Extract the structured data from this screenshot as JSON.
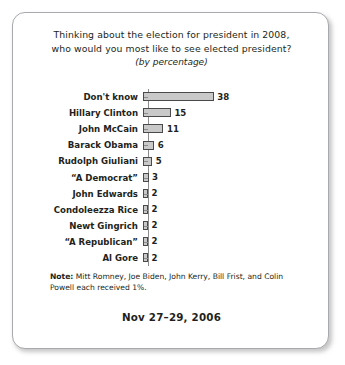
{
  "card": {
    "title_line_1": "Thinking about the election for president in 2008,",
    "title_line_2": "who would you most like to see elected president?",
    "subtitle": "(by percentage)",
    "note_label": "Note:",
    "note_text": " Mitt Romney, Joe Biden, John Kerry, Bill Frist, and Colin Powell each received 1%.",
    "date": "Nov 27–29, 2006"
  },
  "chart_data": {
    "type": "bar",
    "orientation": "horizontal",
    "title": "Thinking about the election for president in 2008, who would you most like to see elected president?",
    "subtitle": "(by percentage)",
    "xlabel": "",
    "ylabel": "",
    "xlim": [
      0,
      40
    ],
    "grid": false,
    "legend": false,
    "unit": "percent",
    "bar_fill_color": "#c9c9c9",
    "bar_border_color": "#4a4a4a",
    "categories": [
      "Don't know",
      "Hillary Clinton",
      "John McCain",
      "Barack Obama",
      "Rudolph Giuliani",
      "“A Democrat”",
      "John Edwards",
      "Condoleezza Rice",
      "Newt Gingrich",
      "“A Republican”",
      "Al Gore"
    ],
    "values": [
      38,
      15,
      11,
      6,
      5,
      3,
      2,
      2,
      2,
      2,
      2
    ],
    "value_labels": [
      "38",
      "15",
      "11",
      "6",
      "5",
      "3",
      "2",
      "2",
      "2",
      "2",
      "2"
    ],
    "annotation": "Note: Mitt Romney, Joe Biden, John Kerry, Bill Frist, and Colin Powell each received 1%.",
    "date": "Nov 27–29, 2006"
  }
}
